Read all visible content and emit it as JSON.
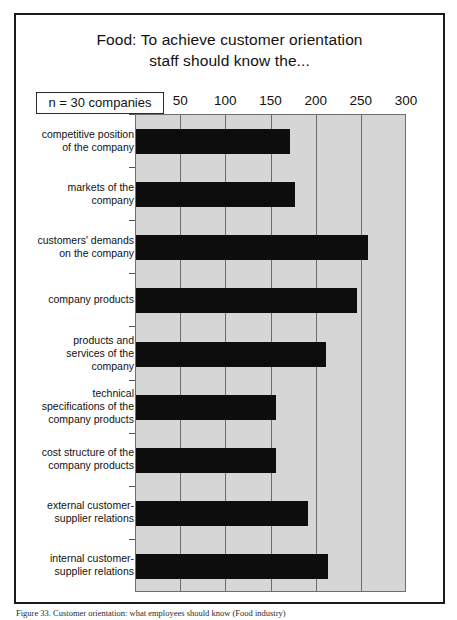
{
  "figure": {
    "title_line1": "Food: To achieve customer orientation",
    "title_line2": "staff should know the...",
    "sample_size": "n = 30 companies",
    "caption": "Figure 33. Customer orientation: what employees should know (Food industry)"
  },
  "colors": {
    "bar": "#0d0d0d",
    "plot_background": "#d6d6d6",
    "gridline": "#6b6b6b",
    "frame": "#1a1a1a",
    "text": "#111111"
  },
  "chart_data": {
    "type": "bar",
    "orientation": "horizontal",
    "title": "Food: To achieve customer orientation staff should know the...",
    "subtitle": "n = 30 companies",
    "xlabel": "",
    "ylabel": "",
    "xlim": [
      0,
      300
    ],
    "xticks": [
      50,
      100,
      150,
      200,
      250,
      300
    ],
    "xtick_labels": [
      "50",
      "100",
      "150",
      "200",
      "250",
      "300"
    ],
    "grid": true,
    "legend": "none",
    "categories": [
      "competitive position of the company",
      "markets of the company",
      "customers' demands on the company",
      "company products",
      "products and services of the company",
      "technical specifications of the company products",
      "cost structure of the company products",
      "external customer-supplier relations",
      "internal customer-supplier relations"
    ],
    "category_lines": [
      [
        "competitive position",
        "of the company"
      ],
      [
        "markets of the",
        "company"
      ],
      [
        "customers' demands",
        "on the company"
      ],
      [
        "company products"
      ],
      [
        "products and",
        "services of the",
        "company"
      ],
      [
        "technical",
        "specifications of the",
        "company products"
      ],
      [
        "cost structure of the",
        "company products"
      ],
      [
        "external customer-",
        "supplier relations"
      ],
      [
        "internal customer-",
        "supplier relations"
      ]
    ],
    "values": [
      170,
      176,
      257,
      245,
      210,
      155,
      155,
      190,
      212
    ]
  }
}
